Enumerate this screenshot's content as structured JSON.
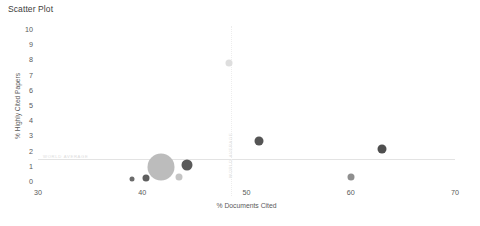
{
  "chart_data": {
    "type": "scatter",
    "title": "Scatter Plot",
    "xlabel": "% Documents Cited",
    "ylabel": "% Highly Cited Papers",
    "xlim": [
      30,
      70
    ],
    "ylim": [
      0,
      10
    ],
    "xticks": [
      30,
      40,
      50,
      60,
      70
    ],
    "yticks": [
      0,
      1,
      2,
      3,
      4,
      5,
      6,
      7,
      8,
      9,
      10
    ],
    "grid": false,
    "legend": "none",
    "reference_lines": [
      {
        "orientation": "horizontal",
        "value": 1.5,
        "label": "WORLD AVERAGE",
        "style": "solid"
      },
      {
        "orientation": "vertical",
        "value": 48.5,
        "label": "WORLD AVERAGE",
        "style": "dotted"
      }
    ],
    "points": [
      {
        "x": 39.0,
        "y": 0.2,
        "size": 5,
        "color": "#6b6b6b"
      },
      {
        "x": 40.4,
        "y": 0.25,
        "size": 7,
        "color": "#5f5f5f"
      },
      {
        "x": 41.8,
        "y": 1.0,
        "size": 27,
        "color": "#bcbcbc"
      },
      {
        "x": 43.5,
        "y": 0.3,
        "size": 7,
        "color": "#c4c4c4"
      },
      {
        "x": 44.3,
        "y": 1.1,
        "size": 11,
        "color": "#5a5a5a"
      },
      {
        "x": 48.3,
        "y": 7.8,
        "size": 7,
        "color": "#dedede"
      },
      {
        "x": 51.2,
        "y": 2.7,
        "size": 9,
        "color": "#555555"
      },
      {
        "x": 60.0,
        "y": 0.3,
        "size": 7,
        "color": "#8f8f8f"
      },
      {
        "x": 63.0,
        "y": 2.2,
        "size": 9,
        "color": "#4f4f4f"
      }
    ]
  },
  "bottom_caption": ""
}
